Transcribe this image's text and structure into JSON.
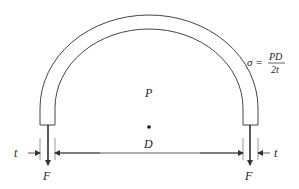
{
  "labels": {
    "pressure": "P",
    "diameter": "D",
    "thickness_left": "t",
    "thickness_right": "t",
    "force_left": "F",
    "force_right": "F"
  },
  "formula": {
    "lhs": "σ =",
    "numerator": "PD",
    "denominator": "2t"
  },
  "colors": {
    "stroke": "#333333",
    "extension": "#999999",
    "text": "#222222"
  }
}
